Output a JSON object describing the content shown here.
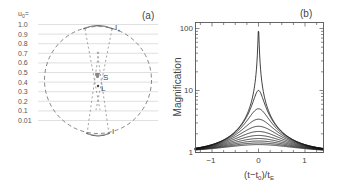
{
  "chart_data": [
    {
      "type": "diagram",
      "panel_label": "(a)",
      "title": "Lens geometry for different impact parameters",
      "u0_header": "u0=",
      "u0_values": [
        "1.0",
        "0.9",
        "0.8",
        "0.7",
        "0.6",
        "0.5",
        "0.4",
        "0.3",
        "0.2",
        "0.1",
        "0.01"
      ],
      "labels": {
        "source": "S",
        "lens": "L",
        "image_plus": "I+",
        "image_minus": "I-"
      },
      "einstein_ring": "dashed circle"
    },
    {
      "type": "line",
      "panel_label": "(b)",
      "xlabel": "(t−t0)/tE",
      "ylabel": "Magnification",
      "yscale": "log",
      "xlim": [
        -1.4,
        1.4
      ],
      "ylim": [
        1,
        125
      ],
      "xticks": [
        "-1",
        "0",
        "1"
      ],
      "yticks": [
        "1",
        "10",
        "100"
      ],
      "grid": false,
      "legend": "none",
      "series": [
        {
          "name": "u0=1.0",
          "peak": 1.34
        },
        {
          "name": "u0=0.9",
          "peak": 1.45
        },
        {
          "name": "u0=0.8",
          "peak": 1.58
        },
        {
          "name": "u0=0.7",
          "peak": 1.77
        },
        {
          "name": "u0=0.6",
          "peak": 2.03
        },
        {
          "name": "u0=0.5",
          "peak": 2.18
        },
        {
          "name": "u0=0.4",
          "peak": 2.63
        },
        {
          "name": "u0=0.3",
          "peak": 3.43
        },
        {
          "name": "u0=0.2",
          "peak": 5.09
        },
        {
          "name": "u0=0.1",
          "peak": 10.04
        },
        {
          "name": "u0=0.01",
          "peak": 100.0
        }
      ],
      "u0_values": [
        1.0,
        0.9,
        0.8,
        0.7,
        0.6,
        0.5,
        0.4,
        0.3,
        0.2,
        0.1,
        0.01
      ]
    }
  ],
  "panel_a": {
    "label": "(a)",
    "u0_header": "u",
    "u0_header_sub": "0",
    "u0_header_eq": "=",
    "rows": [
      "1.0",
      "0.9",
      "0.8",
      "0.7",
      "0.6",
      "0.5",
      "0.4",
      "0.3",
      "0.2",
      "0.1",
      "0.01"
    ],
    "source_label": "S",
    "lens_label": "L",
    "image_plus_label": "I",
    "image_plus_sub": "+",
    "image_minus_label": "I",
    "image_minus_sub": "−"
  },
  "panel_b": {
    "label": "(b)",
    "ylabel": "Magnification",
    "xlabel_main": "(t−t",
    "xlabel_sub0": "0",
    "xlabel_mid": ")/t",
    "xlabel_subE": "E",
    "yticks": [
      "1",
      "10",
      "100"
    ],
    "xticks": [
      "−1",
      "0",
      "1"
    ]
  },
  "colors": {
    "curve": "#111111",
    "axis": "#555555",
    "guide": "#d8d8d8",
    "dashed": "#777777",
    "text": "#444444"
  }
}
